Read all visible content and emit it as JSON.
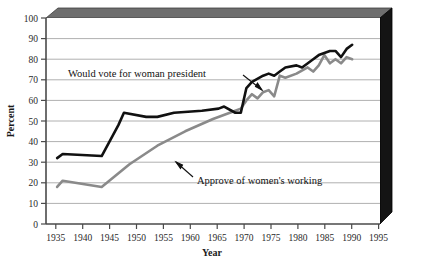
{
  "chart_data": {
    "type": "line",
    "title": "",
    "xlabel": "Year",
    "ylabel": "Percent",
    "xlim": [
      1935,
      1995
    ],
    "ylim": [
      0,
      100
    ],
    "xticks": [
      1935,
      1940,
      1945,
      1950,
      1955,
      1960,
      1965,
      1970,
      1975,
      1980,
      1985,
      1990,
      1995
    ],
    "yticks": [
      0,
      10,
      20,
      30,
      40,
      50,
      60,
      70,
      80,
      90,
      100
    ],
    "grid": "horizontal",
    "legend": "inline-annotations",
    "series": [
      {
        "name": "Would vote for  woman president",
        "color": "#111111",
        "width": 2.6,
        "points": [
          [
            1937,
            32
          ],
          [
            1938,
            34
          ],
          [
            1945,
            33
          ],
          [
            1948,
            48
          ],
          [
            1949,
            54
          ],
          [
            1953,
            52
          ],
          [
            1955,
            52
          ],
          [
            1958,
            54
          ],
          [
            1963,
            55
          ],
          [
            1966,
            56
          ],
          [
            1967,
            57
          ],
          [
            1969,
            54
          ],
          [
            1970,
            54
          ],
          [
            1971,
            66
          ],
          [
            1972,
            69
          ],
          [
            1974,
            72
          ],
          [
            1975,
            73
          ],
          [
            1976,
            72
          ],
          [
            1977,
            74
          ],
          [
            1978,
            76
          ],
          [
            1980,
            77
          ],
          [
            1981,
            76
          ],
          [
            1983,
            80
          ],
          [
            1984,
            82
          ],
          [
            1985,
            83
          ],
          [
            1986,
            84
          ],
          [
            1987,
            84
          ],
          [
            1988,
            81
          ],
          [
            1989,
            85
          ],
          [
            1990,
            87
          ]
        ]
      },
      {
        "name": "Approve of women's working",
        "color": "#8a8a8a",
        "width": 2.6,
        "points": [
          [
            1937,
            18
          ],
          [
            1938,
            21
          ],
          [
            1945,
            18
          ],
          [
            1950,
            29
          ],
          [
            1955,
            38
          ],
          [
            1960,
            45
          ],
          [
            1965,
            51
          ],
          [
            1969,
            55
          ],
          [
            1970,
            56
          ],
          [
            1971,
            60
          ],
          [
            1972,
            63
          ],
          [
            1973,
            61
          ],
          [
            1974,
            64
          ],
          [
            1975,
            65
          ],
          [
            1976,
            62
          ],
          [
            1977,
            72
          ],
          [
            1978,
            71
          ],
          [
            1980,
            73
          ],
          [
            1982,
            76
          ],
          [
            1983,
            74
          ],
          [
            1984,
            77
          ],
          [
            1985,
            82
          ],
          [
            1986,
            78
          ],
          [
            1987,
            80
          ],
          [
            1988,
            78
          ],
          [
            1989,
            81
          ],
          [
            1990,
            80
          ]
        ]
      }
    ],
    "annotations": [
      {
        "text": "Would vote for  woman president",
        "label_x": 68,
        "label_y": 77,
        "arrow": {
          "x1": 243,
          "y1": 77,
          "x2": 262,
          "y2": 90
        }
      },
      {
        "text": "Approve of women's working",
        "label_x": 197,
        "label_y": 181,
        "arrow": {
          "x1": 193,
          "y1": 176,
          "x2": 176,
          "y2": 161
        }
      }
    ]
  },
  "frame": {
    "top_band_color": "#6e6e6e",
    "right_band_color": "#111111",
    "plot_bg": "#ffffff",
    "gridline_color": "#b3b3b3",
    "axis_color": "#5a5a5a"
  }
}
